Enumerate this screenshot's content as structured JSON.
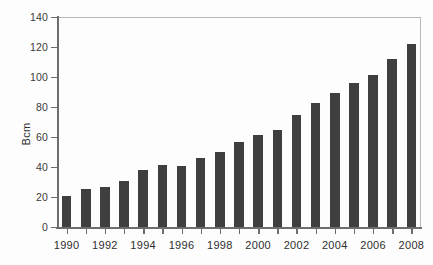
{
  "chart_data": {
    "type": "bar",
    "title": "",
    "subtitle": "",
    "xlabel": "",
    "ylabel": "Bcm",
    "categories": [
      "1990",
      "1991",
      "1992",
      "1993",
      "1994",
      "1995",
      "1996",
      "1997",
      "1998",
      "1999",
      "2000",
      "2001",
      "2002",
      "2003",
      "2004",
      "2005",
      "2006",
      "2007",
      "2008"
    ],
    "values": [
      20.7,
      25.3,
      26.7,
      30.7,
      37.7,
      41.5,
      41.0,
      45.8,
      49.8,
      56.5,
      61.3,
      65.0,
      74.7,
      82.5,
      89.5,
      96.0,
      101.2,
      112.0,
      122.0
    ],
    "ylim": [
      0,
      140
    ],
    "ytick_values": [
      0,
      20,
      40,
      60,
      80,
      100,
      120,
      140
    ],
    "ytick_labels": [
      "0",
      "20",
      "40",
      "60",
      "80",
      "100",
      "120",
      "140"
    ],
    "xtick_labels": [
      "1990",
      "1992",
      "1994",
      "1996",
      "1998",
      "2000",
      "2002",
      "2004",
      "2006",
      "2008"
    ],
    "grid": false,
    "legend": null,
    "legend_position": "none",
    "bar_color": "#3f3f3f",
    "axis_color": "#6d6d6d",
    "frame_color": "#b9b9b9",
    "background_color": "#fdfdfd"
  }
}
